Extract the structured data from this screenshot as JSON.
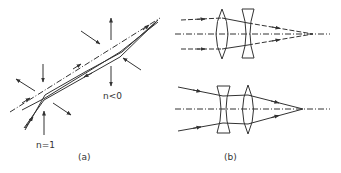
{
  "panel_a": {
    "caption": "(a)",
    "label_n1": "n=1",
    "label_n0": "n<0"
  },
  "panel_b": {
    "caption": "(b)"
  },
  "colors": {
    "line": "#333333",
    "background": "#ffffff"
  }
}
